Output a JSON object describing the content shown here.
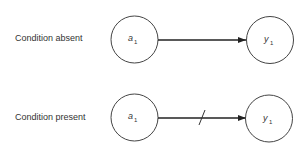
{
  "diagram": {
    "rows": [
      {
        "label": "Condition absent",
        "source": {
          "name": "a",
          "subscript": "1"
        },
        "target": {
          "name": "y",
          "subscript": "1"
        },
        "edge": {
          "blocked": false
        }
      },
      {
        "label": "Condition present",
        "source": {
          "name": "a",
          "subscript": "1"
        },
        "target": {
          "name": "y",
          "subscript": "1"
        },
        "edge": {
          "blocked": true
        }
      }
    ],
    "colors": {
      "stroke": "#444444",
      "text": "#333333",
      "background": "#ffffff"
    }
  }
}
